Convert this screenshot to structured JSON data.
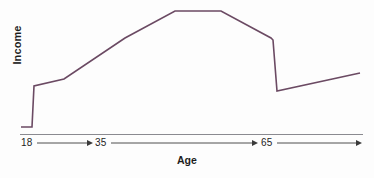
{
  "chart_data": {
    "type": "line",
    "title": "",
    "subtitle": "",
    "xlabel": "Age",
    "ylabel": "Income",
    "grid": false,
    "legend": null,
    "xlim": [
      0,
      100
    ],
    "ylim": [
      0,
      100
    ],
    "xtick_labels": [
      "18",
      "35",
      "65"
    ],
    "xtick_values": [
      18,
      35,
      65
    ],
    "ytick_labels": [],
    "axis_arrows": [
      "18-to-35",
      "35-to-65",
      "65-onward"
    ],
    "series": [
      {
        "name": "Income over lifetime",
        "color": "#6b4a63",
        "x": [
          18,
          18.5,
          22.5,
          24,
          34,
          51,
          63,
          76,
          82,
          83,
          84,
          100
        ],
        "y": [
          6,
          6,
          6,
          40,
          47,
          74,
          95,
          95,
          68,
          67,
          29,
          41
        ],
        "points_px": [
          [
            21,
            127
          ],
          [
            27,
            127
          ],
          [
            32,
            127
          ],
          [
            34,
            86
          ],
          [
            64,
            79
          ],
          [
            125,
            38
          ],
          [
            175,
            11
          ],
          [
            221,
            11
          ],
          [
            271,
            38
          ],
          [
            273,
            40
          ],
          [
            277,
            91
          ],
          [
            360,
            73
          ]
        ]
      }
    ],
    "annotations": [
      {
        "text": "18",
        "position": "x-axis"
      },
      {
        "text": "35",
        "position": "x-axis"
      },
      {
        "text": "65",
        "position": "x-axis"
      }
    ]
  },
  "colors": {
    "line": "#6b4a63",
    "axis": "#8a8a90",
    "arrow": "#3a3a3a",
    "text": "#1d1d1d",
    "background": "#fdfdfd"
  }
}
